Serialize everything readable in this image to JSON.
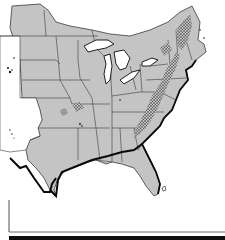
{
  "map": {
    "kind": "species range map",
    "region": "Eastern United States and southern Canada",
    "style": "scanned monochrome",
    "colors": {
      "background": "#ffffff",
      "land_fill": "#c4c4c4",
      "state_border": "#3a3a3a",
      "coastline": "#0a0a0a",
      "water": "#ffffff",
      "range_stipple": "#141414",
      "bottom_bar": "#0d0d0d"
    },
    "features": {
      "great_lakes": [
        "Superior",
        "Michigan",
        "Huron",
        "Erie",
        "Ontario"
      ],
      "range_areas": [
        "Appalachian Mountains",
        "New England uplands",
        "Ozark Plateau",
        "Black Hills outliers"
      ],
      "peninsula": "Florida"
    },
    "labels": []
  }
}
